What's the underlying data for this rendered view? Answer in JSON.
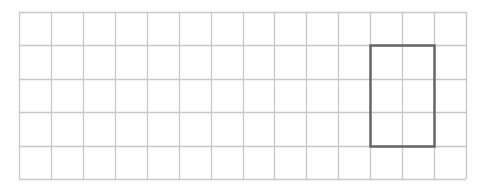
{
  "diagram": {
    "type": "grid-with-rectangle",
    "grid": {
      "columns": 14,
      "rows": 5,
      "origin_x": 19,
      "origin_y": 12,
      "cell_width": 31.93,
      "cell_height": 33.4,
      "line_color": "#c8c8c8"
    },
    "rectangle": {
      "col_start": 11,
      "col_end": 13,
      "row_start": 1,
      "row_end": 4,
      "width_cells": 2,
      "height_cells": 3,
      "stroke_color": "#666666",
      "stroke_width": 2.5
    }
  }
}
